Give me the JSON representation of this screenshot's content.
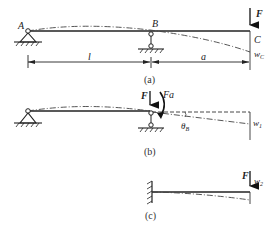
{
  "figure_a": {
    "point_a": "A",
    "point_b": "B",
    "point_c": "C",
    "force": "F",
    "span_ab": "l",
    "span_bc": "a",
    "deflection": "w",
    "deflection_sub": "C",
    "caption": "(a)"
  },
  "figure_b": {
    "force": "F",
    "moment": "Fa",
    "rotation": "θ",
    "rotation_sub": "B",
    "deflection": "w",
    "deflection_sub": "1",
    "caption": "(b)"
  },
  "figure_c": {
    "force": "F",
    "deflection": "w",
    "deflection_sub": "2",
    "caption": "(c)"
  }
}
